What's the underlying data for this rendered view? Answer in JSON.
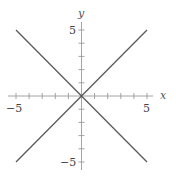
{
  "chart_data": {
    "type": "line",
    "title": "",
    "xlabel": "x",
    "ylabel": "y",
    "xlim": [
      -6,
      6
    ],
    "ylim": [
      -6,
      6
    ],
    "grid": false,
    "legend": null,
    "x_ticks": [
      -5,
      -4,
      -3,
      -2,
      -1,
      1,
      2,
      3,
      4,
      5
    ],
    "y_ticks": [
      -5,
      -4,
      -3,
      -2,
      -1,
      1,
      2,
      3,
      4,
      5
    ],
    "x_tick_labels": [
      {
        "value": -5,
        "label": "−5"
      },
      {
        "value": 5,
        "label": "5"
      }
    ],
    "y_tick_labels": [
      {
        "value": 5,
        "label": "5"
      },
      {
        "value": -5,
        "label": "−5"
      }
    ],
    "series": [
      {
        "name": "y = x",
        "x": [
          -5,
          5
        ],
        "y": [
          -5,
          5
        ],
        "color": "#5a5a5a"
      },
      {
        "name": "y = -x",
        "x": [
          -5,
          5
        ],
        "y": [
          5,
          -5
        ],
        "color": "#5a5a5a"
      }
    ]
  },
  "labels": {
    "x_axis": "x",
    "y_axis": "y",
    "x_min": "−5",
    "x_max": "5",
    "y_max": "5",
    "y_min": "−5"
  }
}
